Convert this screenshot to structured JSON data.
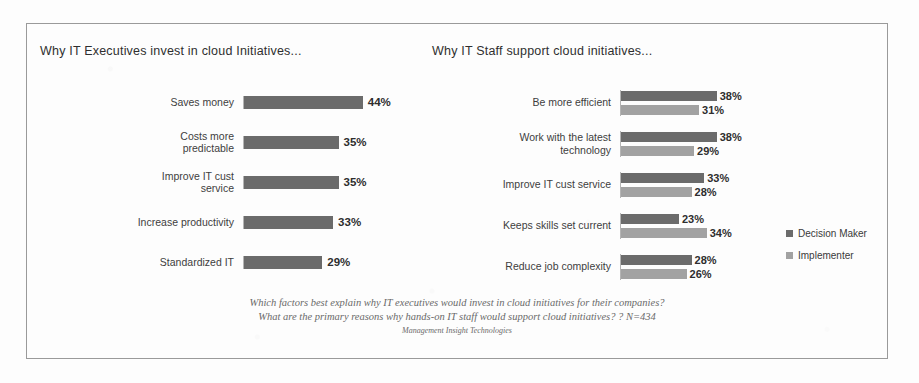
{
  "chart_data": [
    {
      "type": "bar",
      "title": "Why  IT Executives invest in cloud Initiatives...",
      "xlabel": "",
      "ylabel": "",
      "xlim": [
        0,
        50
      ],
      "grid": false,
      "legend": "none",
      "orientation": "horizontal",
      "categories": [
        "Saves money",
        "Costs more predictable",
        "Improve IT cust service",
        "Increase productivity",
        "Standardized IT"
      ],
      "values": [
        44,
        35,
        35,
        33,
        29
      ],
      "value_labels": [
        "44%",
        "35%",
        "35%",
        "33%",
        "29%"
      ],
      "series": [
        {
          "name": "Decision Maker",
          "values": [
            44,
            35,
            35,
            33,
            29
          ],
          "color": "#6b6b6b"
        }
      ]
    },
    {
      "type": "bar",
      "title": "Why  IT Staff support cloud initiatives...",
      "xlabel": "",
      "ylabel": "",
      "xlim": [
        0,
        45
      ],
      "grid": false,
      "legend": "right",
      "orientation": "horizontal",
      "categories": [
        "Be more efficient",
        "Work with the latest technology",
        "Improve IT cust service",
        "Keeps skills set current",
        "Reduce job complexity"
      ],
      "series": [
        {
          "name": "Decision Maker",
          "values": [
            38,
            38,
            33,
            23,
            28
          ],
          "labels": [
            "38%",
            "38%",
            "33%",
            "23%",
            "28%"
          ],
          "color": "#6b6b6b"
        },
        {
          "name": "Implementer",
          "values": [
            31,
            29,
            28,
            34,
            26
          ],
          "labels": [
            "31%",
            "29%",
            "28%",
            "34%",
            "26%"
          ],
          "color": "#a2a2a2"
        }
      ]
    }
  ],
  "titles": {
    "left": "Why  IT Executives invest in cloud Initiatives...",
    "right": "Why  IT Staff support cloud initiatives..."
  },
  "left_chart": {
    "rows": [
      {
        "label_line1": "Saves money",
        "label_line2": "",
        "value": "44%",
        "pct": 44
      },
      {
        "label_line1": "Costs more",
        "label_line2": "predictable",
        "value": "35%",
        "pct": 35
      },
      {
        "label_line1": "Improve IT cust",
        "label_line2": "service",
        "value": "35%",
        "pct": 35
      },
      {
        "label_line1": "Increase productivity",
        "label_line2": "",
        "value": "33%",
        "pct": 33
      },
      {
        "label_line1": "Standardized IT",
        "label_line2": "",
        "value": "29%",
        "pct": 29
      }
    ]
  },
  "right_chart": {
    "rows": [
      {
        "label_line1": "Be more efficient",
        "label_line2": "",
        "dm": "38%",
        "imp": "31%",
        "dm_pct": 38,
        "imp_pct": 31
      },
      {
        "label_line1": "Work with the latest",
        "label_line2": "technology",
        "dm": "38%",
        "imp": "29%",
        "dm_pct": 38,
        "imp_pct": 29
      },
      {
        "label_line1": "Improve IT cust service",
        "label_line2": "",
        "dm": "33%",
        "imp": "28%",
        "dm_pct": 33,
        "imp_pct": 28
      },
      {
        "label_line1": "Keeps skills set current",
        "label_line2": "",
        "dm": "23%",
        "imp": "34%",
        "dm_pct": 23,
        "imp_pct": 34
      },
      {
        "label_line1": "Reduce job complexity",
        "label_line2": "",
        "dm": "28%",
        "imp": "26%",
        "dm_pct": 28,
        "imp_pct": 26
      }
    ]
  },
  "legend": {
    "items": [
      {
        "label": "Decision Maker",
        "color": "#6b6b6b"
      },
      {
        "label": "Implementer",
        "color": "#a2a2a2"
      }
    ]
  },
  "footnote": {
    "line1": "Which factors best explain why IT executives would invest in cloud initiatives for their companies?",
    "line2": "What are the primary reasons why hands-on IT staff would support cloud initiatives? ? N=434",
    "source": "Management Insight Technologies"
  }
}
